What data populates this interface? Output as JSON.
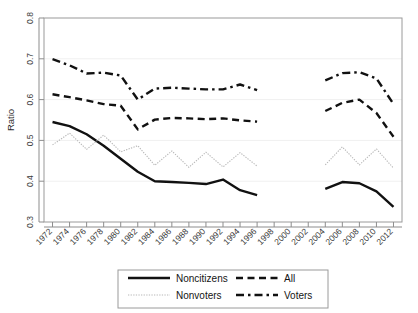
{
  "chart_data": {
    "type": "line",
    "title": "",
    "xlabel": "",
    "ylabel": "Ratio",
    "xlim": [
      1971,
      2013
    ],
    "ylim": [
      0.3,
      0.8
    ],
    "yticks": [
      "0.3",
      "0.4",
      "0.5",
      "0.6",
      "0.7",
      "0.8"
    ],
    "ytick_values": [
      0.3,
      0.4,
      0.5,
      0.6,
      0.7,
      0.8
    ],
    "grid": false,
    "legend_position": "below-plot",
    "x": [
      1972,
      1974,
      1976,
      1978,
      1980,
      1982,
      1984,
      1986,
      1988,
      1990,
      1992,
      1994,
      1996,
      1998,
      2000,
      2002,
      2004,
      2006,
      2008,
      2010,
      2012
    ],
    "xticks": [
      "1972",
      "1974",
      "1976",
      "1978",
      "1980",
      "1982",
      "1984",
      "1986",
      "1988",
      "1990",
      "1992",
      "1994",
      "1996",
      "1998",
      "2000",
      "2002",
      "2004",
      "2006",
      "2008",
      "2010",
      "2012"
    ],
    "series": [
      {
        "name": "Noncitizens",
        "style": "solid",
        "color": "#111111",
        "values": [
          0.545,
          0.535,
          0.515,
          0.487,
          0.455,
          0.423,
          0.4,
          0.398,
          0.396,
          0.393,
          0.404,
          0.378,
          0.366,
          null,
          null,
          null,
          0.381,
          0.398,
          0.395,
          0.375,
          0.337
        ]
      },
      {
        "name": "All",
        "style": "dashed",
        "color": "#111111",
        "values": [
          0.613,
          0.606,
          0.598,
          0.589,
          0.585,
          0.527,
          0.551,
          0.555,
          0.554,
          0.552,
          0.554,
          0.549,
          0.546,
          null,
          null,
          null,
          0.572,
          0.592,
          0.6,
          0.567,
          0.509
        ]
      },
      {
        "name": "Nonvoters",
        "style": "dotted",
        "color": "#b8b8b8",
        "values": [
          0.489,
          0.518,
          0.478,
          0.513,
          0.472,
          0.487,
          0.439,
          0.474,
          0.434,
          0.471,
          0.435,
          0.47,
          0.437,
          null,
          null,
          null,
          0.44,
          0.484,
          0.44,
          0.479,
          0.432
        ]
      },
      {
        "name": "Voters",
        "style": "dashdot",
        "color": "#111111",
        "values": [
          0.699,
          0.684,
          0.664,
          0.666,
          0.659,
          0.6,
          0.627,
          0.629,
          0.627,
          0.625,
          0.625,
          0.637,
          0.623,
          null,
          null,
          null,
          0.647,
          0.665,
          0.667,
          0.652,
          0.589
        ]
      }
    ]
  },
  "legend": {
    "items": [
      {
        "label": "Noncitizens",
        "style": "solid"
      },
      {
        "label": "All",
        "style": "dashed"
      },
      {
        "label": "Nonvoters",
        "style": "dotted"
      },
      {
        "label": "Voters",
        "style": "dashdot"
      }
    ]
  }
}
